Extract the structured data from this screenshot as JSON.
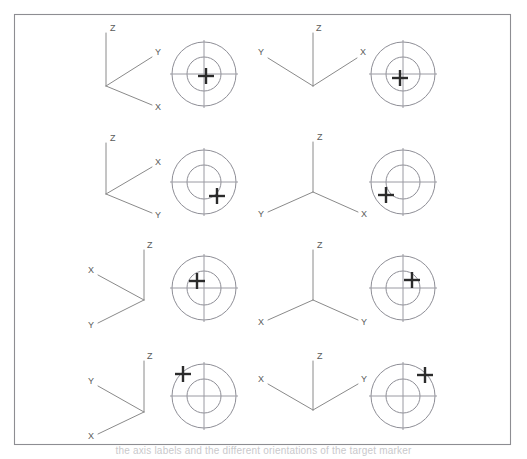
{
  "figure": {
    "title": "",
    "caption_fragment": "the axis labels and the different orientations of the target marker",
    "frame": {
      "x": 14,
      "y": 14,
      "width": 496,
      "height": 430,
      "stroke": "#8d8d92"
    },
    "colors": {
      "axis_line": "#8a8a8a",
      "axis_label": "#5a5a5a",
      "target_circle": "#8e8e96",
      "target_crosshair": "#9a9aa2",
      "marker": "#2b2b2b",
      "background": "#ffffff"
    },
    "axis_label_names": [
      "X",
      "Y",
      "Z"
    ],
    "target_geometry": {
      "outer_radius": 32,
      "inner_radius": 17,
      "crosshair_extent": 34
    },
    "cells": [
      {
        "id": "cell-r1c1",
        "row": 1,
        "column": 1,
        "triad": {
          "origin": {
            "x": 106,
            "y": 86
          },
          "arms": [
            {
              "label": "Z",
              "end": {
                "x": 106,
                "y": 33
              },
              "label_pos": {
                "x": 110,
                "y": 31
              }
            },
            {
              "label": "Y",
              "end": {
                "x": 152,
                "y": 57
              },
              "label_pos": {
                "x": 155,
                "y": 55
              }
            },
            {
              "label": "X",
              "end": {
                "x": 152,
                "y": 105
              },
              "label_pos": {
                "x": 155,
                "y": 110
              }
            }
          ]
        },
        "target": {
          "center": {
            "x": 204,
            "y": 74
          },
          "marker": {
            "x": 206,
            "y": 76
          }
        }
      },
      {
        "id": "cell-r1c2",
        "row": 1,
        "column": 2,
        "triad": {
          "origin": {
            "x": 313,
            "y": 86
          },
          "arms": [
            {
              "label": "Z",
              "end": {
                "x": 313,
                "y": 33
              },
              "label_pos": {
                "x": 316,
                "y": 31
              }
            },
            {
              "label": "Y",
              "end": {
                "x": 268,
                "y": 58
              },
              "label_pos": {
                "x": 258,
                "y": 55
              }
            },
            {
              "label": "X",
              "end": {
                "x": 357,
                "y": 58
              },
              "label_pos": {
                "x": 360,
                "y": 55
              }
            }
          ]
        },
        "target": {
          "center": {
            "x": 403,
            "y": 74
          },
          "marker": {
            "x": 400,
            "y": 78
          }
        }
      },
      {
        "id": "cell-r2c1",
        "row": 2,
        "column": 1,
        "triad": {
          "origin": {
            "x": 106,
            "y": 194
          },
          "arms": [
            {
              "label": "Z",
              "end": {
                "x": 106,
                "y": 143
              },
              "label_pos": {
                "x": 110,
                "y": 141
              }
            },
            {
              "label": "X",
              "end": {
                "x": 152,
                "y": 167
              },
              "label_pos": {
                "x": 155,
                "y": 165
              }
            },
            {
              "label": "Y",
              "end": {
                "x": 152,
                "y": 213
              },
              "label_pos": {
                "x": 155,
                "y": 218
              }
            }
          ]
        },
        "target": {
          "center": {
            "x": 204,
            "y": 182
          },
          "marker": {
            "x": 217,
            "y": 196
          }
        }
      },
      {
        "id": "cell-r2c2",
        "row": 2,
        "column": 2,
        "triad": {
          "origin": {
            "x": 313,
            "y": 192
          },
          "arms": [
            {
              "label": "Z",
              "end": {
                "x": 313,
                "y": 142
              },
              "label_pos": {
                "x": 317,
                "y": 140
              }
            },
            {
              "label": "Y",
              "end": {
                "x": 268,
                "y": 212
              },
              "label_pos": {
                "x": 258,
                "y": 217
              }
            },
            {
              "label": "X",
              "end": {
                "x": 358,
                "y": 212
              },
              "label_pos": {
                "x": 361,
                "y": 217
              }
            }
          ]
        },
        "target": {
          "center": {
            "x": 403,
            "y": 182
          },
          "marker": {
            "x": 386,
            "y": 195
          }
        }
      },
      {
        "id": "cell-r3c1",
        "row": 3,
        "column": 1,
        "triad": {
          "origin": {
            "x": 144,
            "y": 300
          },
          "arms": [
            {
              "label": "Z",
              "end": {
                "x": 144,
                "y": 250
              },
              "label_pos": {
                "x": 147,
                "y": 248
              }
            },
            {
              "label": "X",
              "end": {
                "x": 98,
                "y": 275
              },
              "label_pos": {
                "x": 88,
                "y": 273
              }
            },
            {
              "label": "Y",
              "end": {
                "x": 98,
                "y": 323
              },
              "label_pos": {
                "x": 88,
                "y": 328
              }
            }
          ]
        },
        "target": {
          "center": {
            "x": 204,
            "y": 288
          },
          "marker": {
            "x": 197,
            "y": 281
          }
        }
      },
      {
        "id": "cell-r3c2",
        "row": 3,
        "column": 2,
        "triad": {
          "origin": {
            "x": 313,
            "y": 300
          },
          "arms": [
            {
              "label": "Z",
              "end": {
                "x": 313,
                "y": 250
              },
              "label_pos": {
                "x": 317,
                "y": 248
              }
            },
            {
              "label": "X",
              "end": {
                "x": 268,
                "y": 320
              },
              "label_pos": {
                "x": 258,
                "y": 325
              }
            },
            {
              "label": "Y",
              "end": {
                "x": 358,
                "y": 320
              },
              "label_pos": {
                "x": 361,
                "y": 325
              }
            }
          ]
        },
        "target": {
          "center": {
            "x": 403,
            "y": 288
          },
          "marker": {
            "x": 412,
            "y": 280
          }
        }
      },
      {
        "id": "cell-r4c1",
        "row": 4,
        "column": 1,
        "triad": {
          "origin": {
            "x": 144,
            "y": 412
          },
          "arms": [
            {
              "label": "Z",
              "end": {
                "x": 144,
                "y": 361
              },
              "label_pos": {
                "x": 147,
                "y": 359
              }
            },
            {
              "label": "Y",
              "end": {
                "x": 98,
                "y": 386
              },
              "label_pos": {
                "x": 88,
                "y": 384
              }
            },
            {
              "label": "X",
              "end": {
                "x": 98,
                "y": 434
              },
              "label_pos": {
                "x": 88,
                "y": 439
              }
            }
          ]
        },
        "target": {
          "center": {
            "x": 204,
            "y": 396
          },
          "marker": {
            "x": 183,
            "y": 374
          }
        }
      },
      {
        "id": "cell-r4c2",
        "row": 4,
        "column": 2,
        "triad": {
          "origin": {
            "x": 313,
            "y": 410
          },
          "arms": [
            {
              "label": "Z",
              "end": {
                "x": 313,
                "y": 361
              },
              "label_pos": {
                "x": 317,
                "y": 359
              }
            },
            {
              "label": "X",
              "end": {
                "x": 268,
                "y": 384
              },
              "label_pos": {
                "x": 258,
                "y": 382
              }
            },
            {
              "label": "Y",
              "end": {
                "x": 358,
                "y": 384
              },
              "label_pos": {
                "x": 361,
                "y": 382
              }
            }
          ]
        },
        "target": {
          "center": {
            "x": 403,
            "y": 396
          },
          "marker": {
            "x": 425,
            "y": 375
          }
        }
      }
    ]
  }
}
